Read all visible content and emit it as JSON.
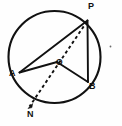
{
  "figure": {
    "stroke_color": "#111111",
    "background_color": "#fefefe"
  },
  "labels": {
    "P": "P",
    "A": "A",
    "O": "O",
    "B": "B",
    "N": "N"
  },
  "geometry": {
    "circle": {
      "cx": 54.5,
      "cy": 57,
      "r": 46
    },
    "points": {
      "P": {
        "x": 87.5,
        "y": 20.5
      },
      "A": {
        "x": 19.5,
        "y": 72.5
      },
      "O": {
        "x": 57.0,
        "y": 62.0
      },
      "B": {
        "x": 88.0,
        "y": 82.0
      },
      "N": {
        "x": 28.0,
        "y": 108.0
      }
    },
    "solid_segments": [
      {
        "name": "chord-AP",
        "from": "A",
        "to": "P"
      },
      {
        "name": "radius-AO",
        "from": "A",
        "to": "O"
      },
      {
        "name": "radius-OB",
        "from": "O",
        "to": "B"
      },
      {
        "name": "chord-PB",
        "from": "P",
        "to": "B"
      }
    ],
    "dashed_segments": [
      {
        "name": "ray-PON",
        "from": "P",
        "through": "O",
        "to": "N",
        "arrow_at": "N"
      }
    ],
    "marks": [
      {
        "name": "stray-dot-right",
        "x": 110.5,
        "y": 46.5,
        "r": 0.9
      }
    ]
  }
}
